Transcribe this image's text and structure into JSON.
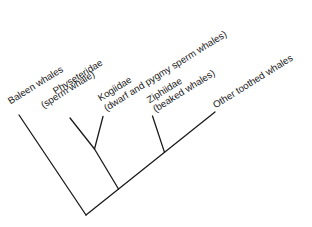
{
  "figure": {
    "type": "cladogram",
    "newick": "(Baleen whales,((Physeteridae,Kogiidae),(Ziphiidae,Other toothed whales)))",
    "background_color": "#ffffff",
    "line_color": "#1a1a1a",
    "text_color": "#1b1b1b",
    "label_rotation_deg": -32,
    "taxa": [
      {
        "name": "Baleen whales",
        "common_name": ""
      },
      {
        "name": "Physeteridae",
        "common_name": "(sperm whale)"
      },
      {
        "name": "Kogiidae",
        "common_name": "(dwarf and pygmy sperm whales)"
      },
      {
        "name": "Ziphiidae",
        "common_name": "(beaked whales)"
      },
      {
        "name": "Other toothed whales",
        "common_name": ""
      }
    ],
    "labels": [
      {
        "name": "baleen-whales",
        "text": "Baleen whales",
        "x": 12.5,
        "y": 105
      },
      {
        "name": "physeteridae",
        "text": "Physeteridae",
        "x": 57.5,
        "y": 95
      },
      {
        "name": "physeteridae-common",
        "text": "(sperm whale)",
        "x": 45.5,
        "y": 109
      },
      {
        "name": "kogiidae",
        "text": "Kogiidae",
        "x": 102.5,
        "y": 102
      },
      {
        "name": "kogiidae-common",
        "text": "(dwarf and pygmy sperm whales)",
        "x": 109,
        "y": 112
      },
      {
        "name": "ziphiidae",
        "text": "Ziphiidae",
        "x": 151.5,
        "y": 104
      },
      {
        "name": "ziphiidae-common",
        "text": "(beaked whales)",
        "x": 158,
        "y": 113.3
      },
      {
        "name": "other-toothed-whales",
        "text": "Other toothed whales",
        "x": 218,
        "y": 108.5
      }
    ],
    "branches": [
      {
        "name": "root-to-baleen-whales-branch",
        "from": [
          86,
          215
        ],
        "to": [
          19,
          115
        ]
      },
      {
        "name": "root-to-other-toothed-whales-branch",
        "from": [
          86,
          215
        ],
        "to": [
          215,
          112
        ]
      },
      {
        "name": "sperm-whale-clade-stem",
        "from": [
          118.5,
          189
        ],
        "to": [
          94.5,
          149
        ]
      },
      {
        "name": "physeteridae-branch",
        "from": [
          94.5,
          149
        ],
        "to": [
          70,
          118
        ]
      },
      {
        "name": "kogiidae-branch",
        "from": [
          94.5,
          149
        ],
        "to": [
          103,
          116.5
        ]
      },
      {
        "name": "ziphiidae-branch",
        "from": [
          164.5,
          152.4
        ],
        "to": [
          152.5,
          116
        ]
      }
    ]
  }
}
